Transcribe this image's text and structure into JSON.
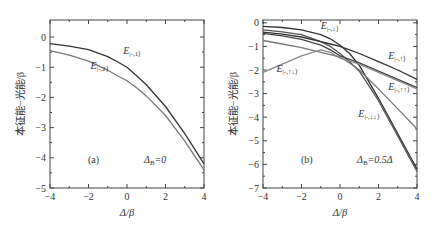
{
  "figure": {
    "panels": [
      "(a)",
      "(b)"
    ],
    "ylabel": "本征能−光能/β",
    "xlabel": "Δ/β"
  },
  "chart_data": [
    {
      "type": "line",
      "panel_label": "(a)",
      "annotation": "Δ_B=0",
      "xlabel": "Δ/β",
      "ylabel": "本征能−光能/β",
      "xlim": [
        -4,
        4
      ],
      "ylim": [
        -5,
        0.5
      ],
      "xticks": [
        -4,
        -2,
        0,
        2,
        4
      ],
      "yticks": [
        0,
        -1,
        -2,
        -3,
        -4,
        -5
      ],
      "grid": false,
      "x": [
        -4,
        -3,
        -2,
        -1,
        -0.5,
        0,
        0.5,
        1,
        2,
        3,
        4
      ],
      "series": [
        {
          "name": "E|-,1⟩",
          "color": "#333333",
          "values": [
            -0.22,
            -0.3,
            -0.42,
            -0.65,
            -0.82,
            -1.0,
            -1.28,
            -1.58,
            -2.3,
            -3.2,
            -4.2
          ]
        },
        {
          "name": "E|-,2⟩",
          "color": "#777777",
          "values": [
            -0.45,
            -0.6,
            -0.8,
            -1.1,
            -1.28,
            -1.45,
            -1.68,
            -1.95,
            -2.6,
            -3.45,
            -4.4
          ]
        }
      ],
      "labels": [
        {
          "text": "E|-,1⟩",
          "x": -0.2,
          "y": -0.55
        },
        {
          "text": "E|-,2⟩",
          "x": -1.9,
          "y": -1.05
        }
      ]
    },
    {
      "type": "line",
      "panel_label": "(b)",
      "annotation": "Δ_B=0.5Δ",
      "xlabel": "Δ/β",
      "ylabel": "本征能−光能/β",
      "xlim": [
        -4,
        4
      ],
      "ylim": [
        -7,
        0.5
      ],
      "xticks": [
        -4,
        -2,
        0,
        2,
        4
      ],
      "yticks": [
        0,
        -1,
        -2,
        -3,
        -4,
        -5,
        -6,
        -7
      ],
      "grid": false,
      "x": [
        -4,
        -3,
        -2,
        -1,
        -0.5,
        0,
        0.5,
        1,
        2,
        3,
        4
      ],
      "series": [
        {
          "name": "E|-,↓⟩",
          "color": "#333333",
          "values": [
            -0.15,
            -0.2,
            -0.3,
            -0.5,
            -0.68,
            -0.95,
            -1.3,
            -1.8,
            -3.2,
            -4.7,
            -6.2
          ]
        },
        {
          "name": "E|-,↓↓⟩",
          "color": "#555555",
          "values": [
            -0.3,
            -0.38,
            -0.5,
            -0.8,
            -1.0,
            -1.3,
            -1.65,
            -2.05,
            -3.3,
            -4.8,
            -6.3
          ]
        },
        {
          "name": "E|-,↑⟩",
          "color": "#333333",
          "values": [
            -0.4,
            -0.48,
            -0.6,
            -0.8,
            -0.9,
            -1.0,
            -1.15,
            -1.3,
            -1.65,
            -2.0,
            -2.4
          ]
        },
        {
          "name": "E|-,↑↑⟩",
          "color": "#444444",
          "values": [
            -0.45,
            -0.55,
            -0.7,
            -0.95,
            -1.15,
            -1.4,
            -1.55,
            -1.7,
            -2.05,
            -2.4,
            -2.75
          ]
        },
        {
          "name": "",
          "color": "#777777",
          "values": [
            -0.75,
            -0.9,
            -1.05,
            -1.25,
            -1.35,
            -1.45,
            -1.7,
            -2.0,
            -2.8,
            -3.65,
            -4.5
          ]
        },
        {
          "name": "E|-,↑↓⟩",
          "color": "#888888",
          "values": [
            -2.1,
            -1.75,
            -1.4,
            -1.15,
            -1.25,
            -1.5,
            -1.62,
            -1.75,
            -2.1,
            -2.45,
            -2.8
          ]
        }
      ],
      "labels": [
        {
          "text": "E|-,↓⟩",
          "x": -1.0,
          "y": -0.25
        },
        {
          "text": "E|-,↑⟩",
          "x": 2.5,
          "y": -1.55
        },
        {
          "text": "E|-,↑↓⟩",
          "x": -3.3,
          "y": -2.1
        },
        {
          "text": "E|-,↑↑⟩",
          "x": 2.5,
          "y": -2.85
        },
        {
          "text": "E|-,↓↓⟩",
          "x": 0.95,
          "y": -4.0
        }
      ]
    }
  ]
}
